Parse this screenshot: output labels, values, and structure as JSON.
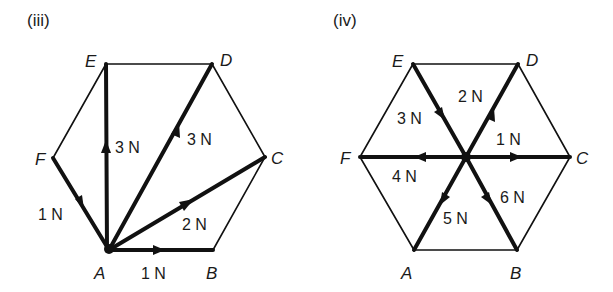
{
  "diagrams": [
    {
      "id": "iii",
      "title": "(iii)",
      "vertices": {
        "A": {
          "label": "A",
          "x": 109,
          "y": 250
        },
        "B": {
          "label": "B",
          "x": 213,
          "y": 250
        },
        "C": {
          "label": "C",
          "x": 265,
          "y": 157
        },
        "D": {
          "label": "D",
          "x": 212,
          "y": 64
        },
        "E": {
          "label": "E",
          "x": 106,
          "y": 64
        },
        "F": {
          "label": "F",
          "x": 53,
          "y": 158
        }
      },
      "forces": [
        {
          "name": "FA",
          "from": "F",
          "to": "A",
          "magnitude": "1 N"
        },
        {
          "name": "AB",
          "from": "A",
          "to": "B",
          "magnitude": "1 N"
        },
        {
          "name": "AC",
          "from": "A",
          "to": "C",
          "magnitude": "2 N"
        },
        {
          "name": "AD",
          "from": "A",
          "to": "D",
          "magnitude": "3 N"
        },
        {
          "name": "AE",
          "from": "A",
          "to": "E",
          "magnitude": "3 N"
        }
      ]
    },
    {
      "id": "iv",
      "title": "(iv)",
      "vertices": {
        "A": {
          "label": "A",
          "x": 414,
          "y": 250
        },
        "B": {
          "label": "B",
          "x": 517,
          "y": 250
        },
        "C": {
          "label": "C",
          "x": 570,
          "y": 157
        },
        "D": {
          "label": "D",
          "x": 518,
          "y": 64
        },
        "E": {
          "label": "E",
          "x": 413,
          "y": 64
        },
        "F": {
          "label": "F",
          "x": 360,
          "y": 157
        },
        "O": {
          "label": "",
          "x": 466,
          "y": 157
        }
      },
      "forces": [
        {
          "name": "EO",
          "from": "E",
          "to": "O",
          "magnitude": "3 N"
        },
        {
          "name": "OD",
          "from": "O",
          "to": "D",
          "magnitude": "2 N"
        },
        {
          "name": "OC",
          "from": "O",
          "to": "C",
          "magnitude": "1 N"
        },
        {
          "name": "OF",
          "from": "O",
          "to": "F",
          "magnitude": "4 N"
        },
        {
          "name": "OA",
          "from": "O",
          "to": "A",
          "magnitude": "5 N"
        },
        {
          "name": "OB",
          "from": "O",
          "to": "B",
          "magnitude": "6 N"
        }
      ]
    }
  ]
}
